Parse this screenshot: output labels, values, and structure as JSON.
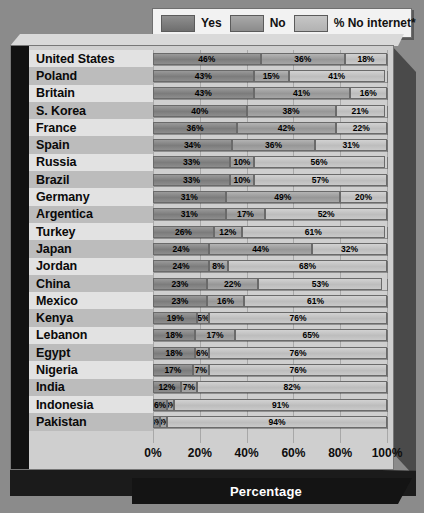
{
  "legend": {
    "items": [
      {
        "label": "Yes",
        "key": "yes",
        "color": "#7c7c7c"
      },
      {
        "label": "No",
        "key": "no",
        "color": "#979797"
      },
      {
        "label": "% No internet*",
        "key": "net",
        "color": "#bdbdbd"
      }
    ]
  },
  "axis": {
    "title": "Percentage",
    "ticks": [
      "0%",
      "20%",
      "40%",
      "60%",
      "80%",
      "100%"
    ]
  },
  "chart_data": {
    "type": "bar",
    "orientation": "horizontal",
    "stacked": true,
    "title": "",
    "xlabel": "Percentage",
    "ylabel": "",
    "xlim": [
      0,
      100
    ],
    "xticks": [
      0,
      20,
      40,
      60,
      80,
      100
    ],
    "grid": true,
    "legend_position": "top",
    "series": [
      {
        "name": "Yes",
        "values": [
          46,
          43,
          43,
          40,
          36,
          34,
          33,
          33,
          31,
          31,
          26,
          24,
          24,
          23,
          23,
          19,
          18,
          18,
          17,
          12,
          6,
          3
        ]
      },
      {
        "name": "No",
        "values": [
          36,
          15,
          41,
          38,
          42,
          36,
          10,
          10,
          49,
          17,
          12,
          44,
          8,
          22,
          16,
          5,
          17,
          6,
          7,
          7,
          3,
          3
        ]
      },
      {
        "name": "% No internet*",
        "values": [
          18,
          41,
          16,
          21,
          22,
          31,
          56,
          57,
          20,
          52,
          61,
          32,
          68,
          53,
          61,
          76,
          65,
          76,
          76,
          82,
          91,
          94
        ]
      }
    ],
    "categories": [
      "United States",
      "Poland",
      "Britain",
      "S. Korea",
      "France",
      "Spain",
      "Russia",
      "Brazil",
      "Germany",
      "Argentica",
      "Turkey",
      "Japan",
      "Jordan",
      "China",
      "Mexico",
      "Kenya",
      "Lebanon",
      "Egypt",
      "Nigeria",
      "India",
      "Indonesia",
      "Pakistan"
    ],
    "labels": [
      {
        "country": "United States",
        "yes": "46%",
        "no": "36%",
        "net": "18%"
      },
      {
        "country": "Poland",
        "yes": "43%",
        "no": "15%",
        "net": "41%"
      },
      {
        "country": "Britain",
        "yes": "43%",
        "no": "41%",
        "net": "16%"
      },
      {
        "country": "S. Korea",
        "yes": "40%",
        "no": "38%",
        "net": "21%"
      },
      {
        "country": "France",
        "yes": "36%",
        "no": "42%",
        "net": "22%"
      },
      {
        "country": "Spain",
        "yes": "34%",
        "no": "36%",
        "net": "31%"
      },
      {
        "country": "Russia",
        "yes": "33%",
        "no": "10%",
        "net": "56%"
      },
      {
        "country": "Brazil",
        "yes": "33%",
        "no": "10%",
        "net": "57%"
      },
      {
        "country": "Germany",
        "yes": "31%",
        "no": "49%",
        "net": "20%"
      },
      {
        "country": "Argentica",
        "yes": "31%",
        "no": "17%",
        "net": "52%"
      },
      {
        "country": "Turkey",
        "yes": "26%",
        "no": "12%",
        "net": "61%"
      },
      {
        "country": "Japan",
        "yes": "24%",
        "no": "44%",
        "net": "32%"
      },
      {
        "country": "Jordan",
        "yes": "24%",
        "no": "8%",
        "net": "68%"
      },
      {
        "country": "China",
        "yes": "23%",
        "no": "22%",
        "net": "53%"
      },
      {
        "country": "Mexico",
        "yes": "23%",
        "no": "16%",
        "net": "61%"
      },
      {
        "country": "Kenya",
        "yes": "19%",
        "no": "5%",
        "net": "76%"
      },
      {
        "country": "Lebanon",
        "yes": "18%",
        "no": "17%",
        "net": "65%"
      },
      {
        "country": "Egypt",
        "yes": "18%",
        "no": "6%",
        "net": "76%"
      },
      {
        "country": "Nigeria",
        "yes": "17%",
        "no": "7%",
        "net": "76%"
      },
      {
        "country": "India",
        "yes": "12%",
        "no": "7%",
        "net": "82%"
      },
      {
        "country": "Indonesia",
        "yes": "6%",
        "no": "3%",
        "net": "91%"
      },
      {
        "country": "Pakistan",
        "yes": "3%",
        "no": "3%",
        "net": "94%"
      }
    ]
  }
}
